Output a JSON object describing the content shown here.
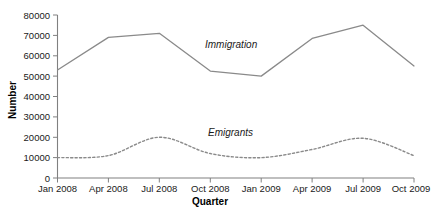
{
  "chart_data": {
    "type": "line",
    "title": "",
    "xlabel": "Quarter",
    "ylabel": "Number",
    "categories": [
      "Jan 2008",
      "Apr 2008",
      "Jul 2008",
      "Oct 2008",
      "Jan 2009",
      "Apr 2009",
      "Jul 2009",
      "Oct 2009"
    ],
    "ylim": [
      0,
      80000
    ],
    "ytick_values": [
      0,
      10000,
      20000,
      30000,
      40000,
      50000,
      60000,
      70000,
      80000
    ],
    "ytick_labels": [
      "0",
      "10000",
      "20000",
      "30000",
      "40000",
      "50000",
      "60000",
      "70000",
      "80000"
    ],
    "grid": false,
    "legend_position": "inline-annotation",
    "series": [
      {
        "name": "Immigration",
        "style": "solid",
        "color": "#8a8a8a",
        "values": [
          53000,
          69000,
          71000,
          52500,
          50000,
          68500,
          75000,
          55000
        ],
        "annotation": "Immigration"
      },
      {
        "name": "Emigrants",
        "style": "dotted",
        "color": "#8a8a8a",
        "values": [
          10000,
          11000,
          20000,
          12000,
          10000,
          14000,
          19500,
          11000
        ],
        "annotation": "Emigrants"
      }
    ],
    "annotations": [
      {
        "text": "Immigration",
        "x": 240,
        "y": 48
      },
      {
        "text": "Emigrants",
        "x": 240,
        "y": 135
      }
    ]
  },
  "axes": {
    "y_title": "Number",
    "x_title": "Quarter"
  }
}
